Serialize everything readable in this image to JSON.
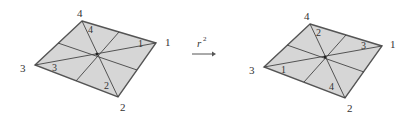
{
  "colors": {
    "fill": "#d6d6d6",
    "edge": "#555555",
    "line": "#444444",
    "text": "#333333"
  },
  "operation": {
    "symbol": "r",
    "exponent": "2"
  },
  "figures": [
    {
      "name": "before",
      "vertices": {
        "top": [
          82,
          21
        ],
        "right": [
          156,
          43
        ],
        "bottom": [
          118,
          97
        ],
        "left": [
          35,
          65
        ],
        "center": [
          97,
          54
        ]
      },
      "corner_labels": {
        "top": "4",
        "right": "1",
        "bottom": "2",
        "left": "3"
      },
      "inner_labels": {
        "top": "4",
        "right": "1",
        "bottom": "2",
        "left": "3"
      }
    },
    {
      "name": "after",
      "vertices": {
        "top": [
          310,
          24
        ],
        "right": [
          382,
          46
        ],
        "bottom": [
          345,
          98
        ],
        "left": [
          264,
          67
        ],
        "center": [
          325,
          57
        ]
      },
      "corner_labels": {
        "top": "4",
        "right": "1",
        "bottom": "2",
        "left": "3"
      },
      "inner_labels": {
        "top": "2",
        "right": "3",
        "bottom": "4",
        "left": "1"
      }
    }
  ]
}
